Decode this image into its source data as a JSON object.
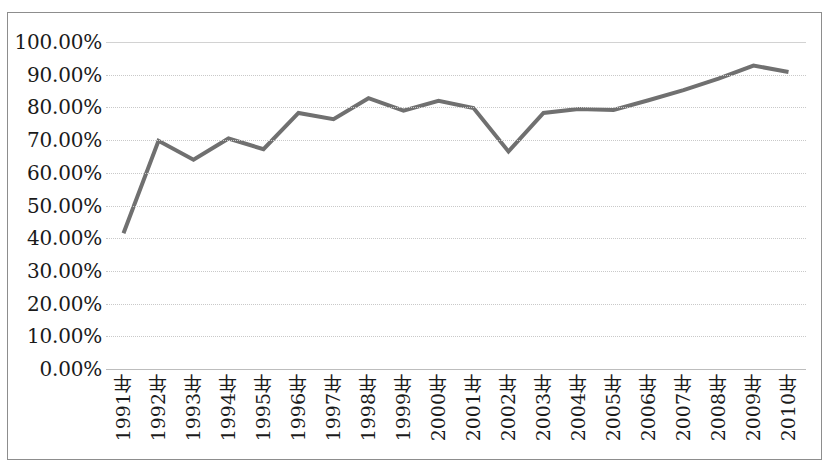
{
  "chart_data": {
    "type": "line",
    "title": "",
    "subtitle": "",
    "xlabel": "",
    "ylabel": "",
    "legend": [],
    "legend_position": "none",
    "grid": true,
    "grid_axis": "y",
    "ylim": [
      0,
      1.0
    ],
    "ytick_labels": [
      "100.00%",
      "90.00%",
      "80.00%",
      "70.00%",
      "60.00%",
      "50.00%",
      "40.00%",
      "30.00%",
      "20.00%",
      "10.00%",
      "0.00%"
    ],
    "ytick_values": [
      1.0,
      0.9,
      0.8,
      0.7,
      0.6,
      0.5,
      0.4,
      0.3,
      0.2,
      0.1,
      0.0
    ],
    "categories": [
      "1991年",
      "1992年",
      "1993年",
      "1994年",
      "1995年",
      "1996年",
      "1997年",
      "1998年",
      "1999年",
      "2000年",
      "2001年",
      "2002年",
      "2003年",
      "2004年",
      "2005年",
      "2006年",
      "2007年",
      "2008年",
      "2009年",
      "2010年"
    ],
    "values": [
      0.415,
      0.698,
      0.64,
      0.705,
      0.672,
      0.783,
      0.764,
      0.828,
      0.79,
      0.82,
      0.798,
      0.665,
      0.783,
      0.795,
      0.792,
      0.822,
      0.853,
      0.888,
      0.928,
      0.908
    ],
    "value_labels": [
      "41.50%",
      "69.80%",
      "64.00%",
      "70.50%",
      "67.20%",
      "78.30%",
      "76.40%",
      "82.80%",
      "79.00%",
      "82.00%",
      "79.80%",
      "66.50%",
      "78.30%",
      "79.50%",
      "79.20%",
      "82.20%",
      "85.30%",
      "88.80%",
      "92.80%",
      "90.80%"
    ],
    "series": [
      {
        "name": "",
        "color": "#707070",
        "line_width": 4,
        "marker": "none",
        "values": [
          0.415,
          0.698,
          0.64,
          0.705,
          0.672,
          0.783,
          0.764,
          0.828,
          0.79,
          0.82,
          0.798,
          0.665,
          0.783,
          0.795,
          0.792,
          0.822,
          0.853,
          0.888,
          0.928,
          0.908
        ]
      }
    ],
    "colors": {
      "series_line": "#707070",
      "gridline": "#c9c9c9",
      "border": "#8d8d8d",
      "text": "#1a1a1a",
      "background": "#ffffff"
    }
  }
}
